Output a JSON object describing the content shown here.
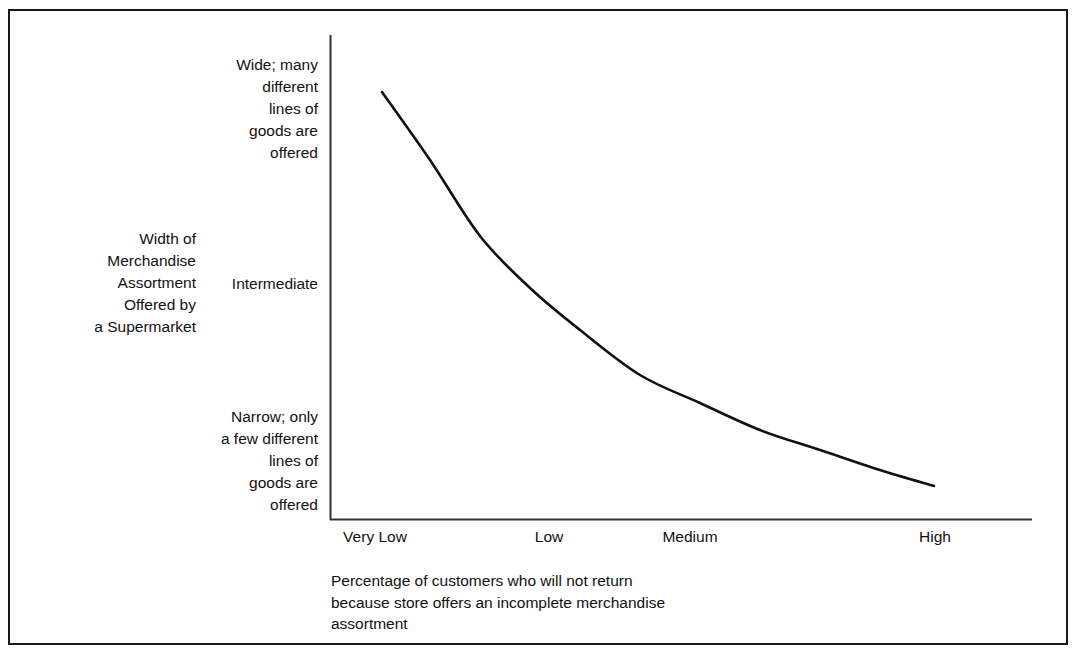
{
  "chart_data": {
    "type": "line",
    "title": "",
    "xlabel": "Percentage of customers who will not return because store offers an incomplete merchandise assortment",
    "ylabel": "Width of Merchandise Assortment Offered by a Supermarket",
    "x_tick_labels": [
      "Very Low",
      "Low",
      "Medium",
      "High"
    ],
    "y_tick_labels": [
      "Wide; many different lines of goods are offered",
      "Intermediate",
      "Narrow; only a few different lines of goods are offered"
    ],
    "grid": false,
    "legend": false,
    "series": [
      {
        "name": "Assortment width vs. percentage of non-returning customers",
        "x": [
          "Very Low",
          "Low",
          "Medium",
          "High"
        ],
        "values": [
          "Wide",
          "Intermediate-high",
          "Low-intermediate",
          "Narrow"
        ],
        "points": [
          [
            382,
            92
          ],
          [
            430,
            160
          ],
          [
            480,
            236
          ],
          [
            530,
            288
          ],
          [
            580,
            330
          ],
          [
            640,
            375
          ],
          [
            700,
            403
          ],
          [
            760,
            430
          ],
          [
            820,
            450
          ],
          [
            880,
            470
          ],
          [
            934,
            486
          ]
        ],
        "shape": "monotonic decreasing convex curve"
      }
    ],
    "annotations": []
  },
  "axes": {
    "y_title": "Width of\nMerchandise\nAssortment\nOffered by\na Supermarket",
    "y_labels": {
      "top": "Wide; many\ndifferent\nlines of\ngoods are\noffered",
      "middle": "Intermediate",
      "bottom": "Narrow; only\na few different\nlines of\ngoods are\noffered"
    },
    "x_ticks": [
      {
        "label": "Very Low",
        "x": 375
      },
      {
        "label": "Low",
        "x": 549
      },
      {
        "label": "Medium",
        "x": 690
      },
      {
        "label": "High",
        "x": 935
      }
    ],
    "x_caption": "Percentage of customers who will not return\nbecause store offers an incomplete merchandise\nassortment"
  },
  "style": {
    "line_color": "#111111",
    "axis_color": "#333333",
    "frame_color": "#1a1a1a",
    "background": "#ffffff",
    "text_color": "#111111"
  }
}
